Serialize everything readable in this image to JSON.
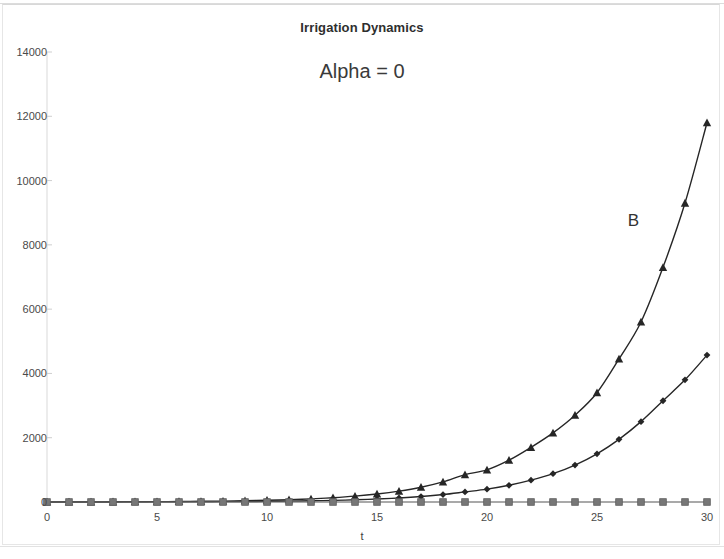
{
  "chart_data": {
    "type": "line",
    "title": "Irrigation Dynamics",
    "annotation": "Alpha = 0",
    "xlabel": "t",
    "ylabel": "",
    "xlim": [
      0,
      30
    ],
    "ylim": [
      0,
      14000
    ],
    "grid": false,
    "legend_position": "none",
    "x_tick_labels": [
      "0",
      "5",
      "10",
      "15",
      "20",
      "25",
      "30"
    ],
    "x_ticks": [
      0,
      5,
      10,
      15,
      20,
      25,
      30
    ],
    "y_tick_labels": [
      "0",
      "2000",
      "4000",
      "6000",
      "8000",
      "10000",
      "12000",
      "14000"
    ],
    "y_ticks": [
      0,
      2000,
      4000,
      6000,
      8000,
      10000,
      12000,
      14000
    ],
    "x": [
      0,
      1,
      2,
      3,
      4,
      5,
      6,
      7,
      8,
      9,
      10,
      11,
      12,
      13,
      14,
      15,
      16,
      17,
      18,
      19,
      20,
      21,
      22,
      23,
      24,
      25,
      26,
      27,
      28,
      29,
      30
    ],
    "series": [
      {
        "name": "B",
        "label": "B",
        "marker": "triangle",
        "color": "#262626",
        "values": [
          2,
          3,
          4,
          6,
          8,
          11,
          15,
          21,
          28,
          39,
          53,
          72,
          98,
          134,
          182,
          248,
          338,
          460,
          626,
          852,
          1000,
          1300,
          1700,
          2150,
          2700,
          3400,
          4450,
          5600,
          7300,
          9300,
          11800
        ]
      },
      {
        "name": "series-2",
        "label": "",
        "marker": "diamond",
        "color": "#262626",
        "values": [
          1,
          1,
          2,
          2,
          3,
          4,
          6,
          8,
          11,
          15,
          20,
          27,
          37,
          50,
          68,
          92,
          125,
          170,
          231,
          314,
          400,
          520,
          680,
          880,
          1150,
          1500,
          1950,
          2500,
          3150,
          3800,
          4570
        ]
      },
      {
        "name": "series-3",
        "label": "",
        "marker": "square",
        "color": "#777777",
        "values": [
          0,
          0,
          0,
          0,
          0,
          0,
          0,
          0,
          0,
          0,
          0,
          0,
          0,
          0,
          0,
          0,
          0,
          0,
          0,
          0,
          0,
          0,
          0,
          0,
          0,
          0,
          0,
          0,
          0,
          0,
          0
        ]
      }
    ],
    "annotations": [
      {
        "text": "B",
        "x": 26.4,
        "y": 9050
      }
    ]
  }
}
